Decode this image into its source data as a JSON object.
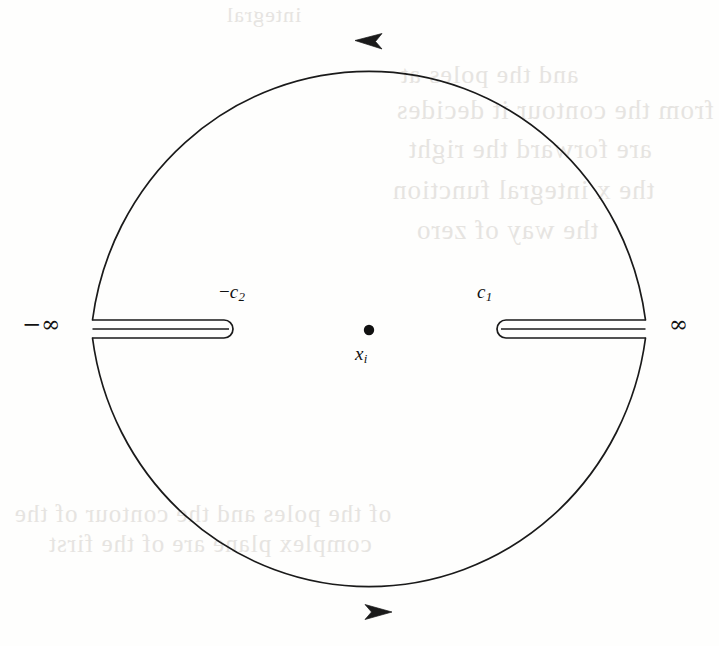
{
  "figure": {
    "kind": "complex-plane-contour-diagram",
    "background_color": "#fefefd",
    "ink_color": "#111111",
    "bleed_color": "#e6e4e1"
  },
  "contour": {
    "circle": {
      "center_x": 369,
      "center_y": 326,
      "radius_x": 279,
      "radius_y": 287,
      "stroke_width": 1.6
    },
    "arrows": [
      {
        "name": "top-arrow",
        "x": 372,
        "y": 40,
        "direction": "left",
        "label": "counterclockwise-top"
      },
      {
        "name": "bottom-arrow",
        "x": 378,
        "y": 612,
        "direction": "right",
        "label": "counterclockwise-bottom"
      }
    ],
    "branch_cuts": [
      {
        "name": "left-branch-cut",
        "from_x": 92,
        "to_x": 233,
        "center_y": 329,
        "half_height": 9,
        "rounded_end": "right",
        "endpoint_label": "-c2",
        "infinity_label": "-infinity"
      },
      {
        "name": "right-branch-cut",
        "from_x": 497,
        "to_x": 646,
        "center_y": 329,
        "half_height": 9,
        "rounded_end": "left",
        "endpoint_label": "c1",
        "infinity_label": "infinity"
      }
    ],
    "pole": {
      "name": "pole-point",
      "x": 369,
      "y": 330,
      "radius": 5.2
    }
  },
  "labels": {
    "minus_infinity": {
      "text": "−∞",
      "x": 22,
      "y": 311,
      "font_size": 23
    },
    "plus_infinity": {
      "text": "∞",
      "x": 669,
      "y": 311,
      "font_size": 23
    },
    "minus_c2": {
      "prefix": "−",
      "symbol": "c",
      "subscript": "2",
      "x": 219,
      "y": 281,
      "font_size": 19
    },
    "c1": {
      "prefix": "",
      "symbol": "c",
      "subscript": "1",
      "x": 477,
      "y": 281,
      "font_size": 19
    },
    "pole_label": {
      "symbol": "x",
      "subscript": "i",
      "x": 355,
      "y": 343,
      "font_size": 19
    }
  },
  "bleed_through_text": {
    "note": "Faint mirrored show-through from the reverse side of the scanned page; illegible.",
    "lines": [
      {
        "text": "and the poles at",
        "x": 400,
        "y": 60,
        "font_size": 26
      },
      {
        "text": "from the contour  it decides",
        "x": 396,
        "y": 95,
        "font_size": 27
      },
      {
        "text": "are  forward the  right",
        "x": 408,
        "y": 134,
        "font_size": 27
      },
      {
        "text": "the  x  integral  function",
        "x": 392,
        "y": 175,
        "font_size": 27
      },
      {
        "text": "the way  of  zero",
        "x": 416,
        "y": 215,
        "font_size": 27
      },
      {
        "text": "of the  poles  and  the  contour  of  the",
        "x": 14,
        "y": 500,
        "font_size": 25
      },
      {
        "text": "complex  plane   are   of   the   first",
        "x": 48,
        "y": 530,
        "font_size": 25
      },
      {
        "text": "integral",
        "x": 226,
        "y": 2,
        "font_size": 22
      }
    ]
  }
}
